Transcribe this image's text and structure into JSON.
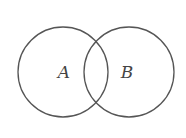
{
  "diagram": {
    "type": "venn",
    "sets": [
      {
        "label": "A",
        "cx": 63,
        "cy": 72,
        "r": 45
      },
      {
        "label": "B",
        "cx": 129,
        "cy": 72,
        "r": 45
      }
    ],
    "stroke_color": "#555555"
  }
}
